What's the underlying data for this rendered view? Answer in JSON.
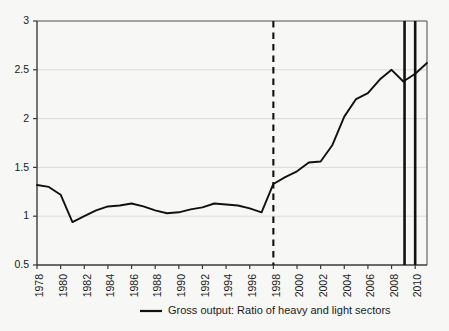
{
  "chart_data": {
    "type": "line",
    "title": "",
    "subtitle": "",
    "xlabel": "",
    "ylabel": "",
    "xlim": [
      1978,
      2011
    ],
    "ylim": [
      0.5,
      3
    ],
    "yticks": [
      0.5,
      1,
      1.5,
      2,
      2.5,
      3
    ],
    "ytick_labels": [
      "0.5",
      "1",
      "1.5",
      "2",
      "2.5",
      "3"
    ],
    "xticks": [
      1978,
      1980,
      1982,
      1984,
      1986,
      1988,
      1990,
      1992,
      1994,
      1996,
      1998,
      2000,
      2002,
      2004,
      2006,
      2008,
      2010
    ],
    "xtick_labels": [
      "1978",
      "1980",
      "1982",
      "1984",
      "1986",
      "1988",
      "1990",
      "1992",
      "1994",
      "1996",
      "1998",
      "2000",
      "2002",
      "2004",
      "2006",
      "2008",
      "2010"
    ],
    "grid": "horizontal",
    "legend_position": "bottom",
    "series": [
      {
        "name": "Gross output: Ratio of heavy and light sectors",
        "color": "#111111",
        "x": [
          1978,
          1979,
          1980,
          1981,
          1982,
          1983,
          1984,
          1985,
          1986,
          1987,
          1988,
          1989,
          1990,
          1991,
          1992,
          1993,
          1994,
          1995,
          1996,
          1997,
          1998,
          1999,
          2000,
          2001,
          2002,
          2003,
          2004,
          2005,
          2006,
          2007,
          2008,
          2009,
          2010,
          2011
        ],
        "values": [
          1.32,
          1.3,
          1.22,
          0.94,
          1.0,
          1.06,
          1.1,
          1.11,
          1.13,
          1.1,
          1.06,
          1.03,
          1.04,
          1.07,
          1.09,
          1.13,
          1.12,
          1.11,
          1.08,
          1.04,
          1.33,
          1.4,
          1.46,
          1.55,
          1.56,
          1.73,
          2.02,
          2.2,
          2.26,
          2.4,
          2.5,
          2.38,
          2.46,
          2.57
        ]
      }
    ],
    "annotations": [
      {
        "name": "wto-accession-marker",
        "type": "vline",
        "x": 1998,
        "style": "dashed",
        "color": "#111111"
      },
      {
        "name": "crisis-marker-start",
        "type": "vline",
        "x": 2009.1,
        "style": "solid",
        "color": "#111111"
      },
      {
        "name": "crisis-marker-end",
        "type": "vline",
        "x": 2010.0,
        "style": "solid",
        "color": "#111111"
      }
    ]
  },
  "legend": {
    "entries": [
      {
        "label": "Gross output: Ratio of heavy and light sectors",
        "color": "#111111"
      }
    ]
  },
  "colors": {
    "background": "#f7f7f6",
    "axis": "#4a4a4a",
    "grid": "#d8d8d8",
    "line": "#111111",
    "text": "#1a1a1a"
  }
}
